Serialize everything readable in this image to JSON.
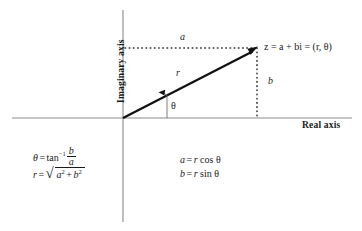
{
  "figure": {
    "axes": {
      "imaginary_label": "Imaginary axis",
      "real_label": "Real axis",
      "origin": {
        "x": 123,
        "y": 118
      }
    },
    "point": {
      "label": "z = a + bi = (r, θ)",
      "x": 257,
      "y": 48
    },
    "labels": {
      "a": "a",
      "b": "b",
      "r": "r",
      "theta": "θ"
    },
    "formulas": {
      "theta": {
        "lhs": "θ",
        "eq": "=",
        "fn": "tan",
        "exponent": "−1",
        "numerator": "b",
        "denominator": "a"
      },
      "r": {
        "lhs": "r",
        "eq": "=",
        "radical": "√",
        "term1": "a",
        "exp1": "2",
        "plus": "+",
        "term2": "b",
        "exp2": "2"
      },
      "a": {
        "lhs": "a",
        "eq": "=",
        "rhs_r": "r",
        "rhs_fn": "cos",
        "rhs_theta": "θ"
      },
      "b": {
        "lhs": "b",
        "eq": "=",
        "rhs_r": "r",
        "rhs_fn": "sin",
        "rhs_theta": "θ"
      }
    },
    "colors": {
      "axis": "#8a8a8a",
      "vector": "#111111",
      "dotted": "#2b2b2b",
      "text": "#1a1a1a",
      "background": "#ffffff"
    }
  }
}
